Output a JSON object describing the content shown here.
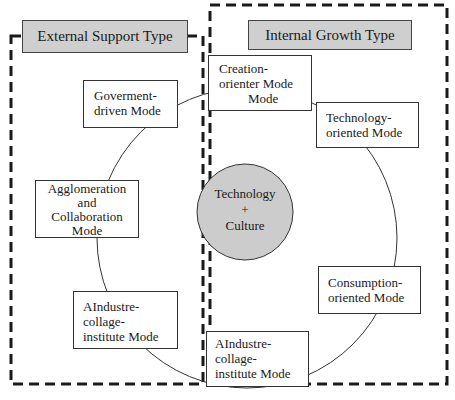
{
  "diagram": {
    "groups": [
      {
        "id": "external",
        "title": "External Support Type"
      },
      {
        "id": "internal",
        "title": "Internal Growth Type"
      }
    ],
    "core": {
      "line1": "Technology",
      "line2": "+",
      "line3": "Culture",
      "fill": "#cccccc"
    },
    "nodes": {
      "government": {
        "l1": "Goverment-",
        "l2": "driven Mode"
      },
      "agglomeration": {
        "l1": "Agglomeration",
        "l2": "and",
        "l3": "Collaboration",
        "l4": "Mode"
      },
      "industry_left": {
        "l1": "AIndustre-",
        "l2": "collage-",
        "l3": "institute Mode"
      },
      "creation": {
        "l1": "Creation-",
        "l2": "orienter Mode",
        "l3": "Mode"
      },
      "technology": {
        "l1": "Technology-",
        "l2": "oriented Mode"
      },
      "consumption": {
        "l1": "Consumption-",
        "l2": "oriented Mode"
      },
      "industry_bottom": {
        "l1": "AIndustre-",
        "l2": "collage-",
        "l3": "institute Mode"
      }
    },
    "colors": {
      "title_fill": "#cfcfcf",
      "core_fill": "#cccccc",
      "stroke": "#222222"
    }
  }
}
